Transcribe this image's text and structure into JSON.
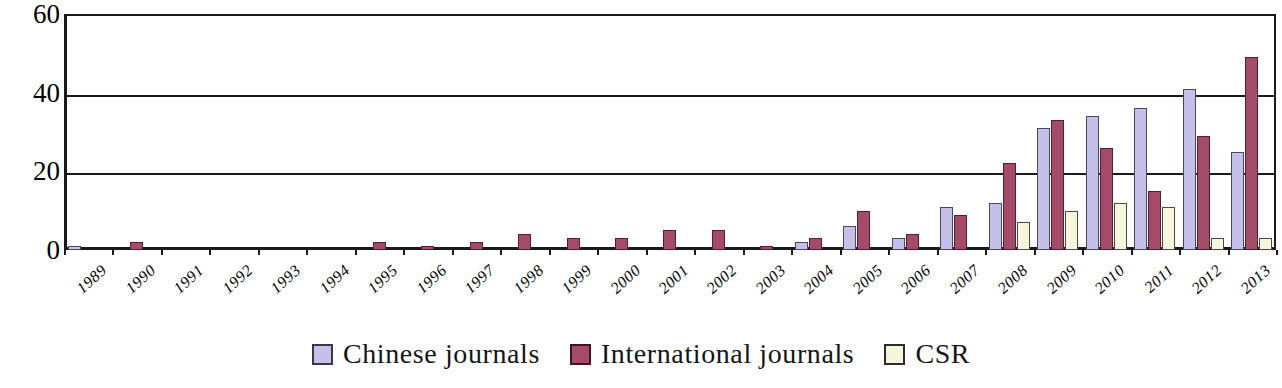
{
  "chart_data": {
    "type": "bar",
    "title": "",
    "subtitle": "",
    "xlabel": "",
    "ylabel": "",
    "ylim": [
      0,
      60
    ],
    "yticks": [
      0,
      20,
      40,
      60
    ],
    "grid": true,
    "legend_position": "bottom-center",
    "orientation": "vertical",
    "grouping": "clustered",
    "categories": [
      "1989",
      "1990",
      "1991",
      "1992",
      "1993",
      "1994",
      "1995",
      "1996",
      "1997",
      "1998",
      "1999",
      "2000",
      "2001",
      "2002",
      "2003",
      "2004",
      "2005",
      "2006",
      "2007",
      "2008",
      "2009",
      "2010",
      "2011",
      "2012",
      "2013"
    ],
    "series": [
      {
        "name": "Chinese journals",
        "color": "#c5c0e8",
        "values": [
          1,
          0,
          0,
          0,
          0,
          0,
          0,
          0,
          0,
          0,
          0,
          0,
          0,
          0,
          0,
          2,
          6,
          3,
          11,
          12,
          31,
          34,
          36,
          41,
          25
        ]
      },
      {
        "name": "International journals",
        "color": "#a54a68",
        "values": [
          0,
          2,
          0,
          0,
          0,
          0,
          2,
          1,
          2,
          4,
          3,
          3,
          5,
          5,
          1,
          3,
          10,
          4,
          9,
          22,
          33,
          26,
          15,
          29,
          49
        ]
      },
      {
        "name": "CSR",
        "color": "#f7f5dc",
        "values": [
          0,
          0,
          0,
          0,
          0,
          0,
          0,
          0,
          0,
          0,
          0,
          0,
          0,
          0,
          0,
          0,
          0,
          0,
          0,
          7,
          10,
          12,
          11,
          3,
          3
        ]
      }
    ]
  },
  "legend": {
    "items": [
      {
        "label": "Chinese journals",
        "color": "#c5c0e8"
      },
      {
        "label": "International journals",
        "color": "#a54a68"
      },
      {
        "label": "CSR",
        "color": "#f7f5dc"
      }
    ]
  },
  "axis": {
    "y_tick_labels": [
      "60",
      "40",
      "20",
      "0"
    ]
  }
}
